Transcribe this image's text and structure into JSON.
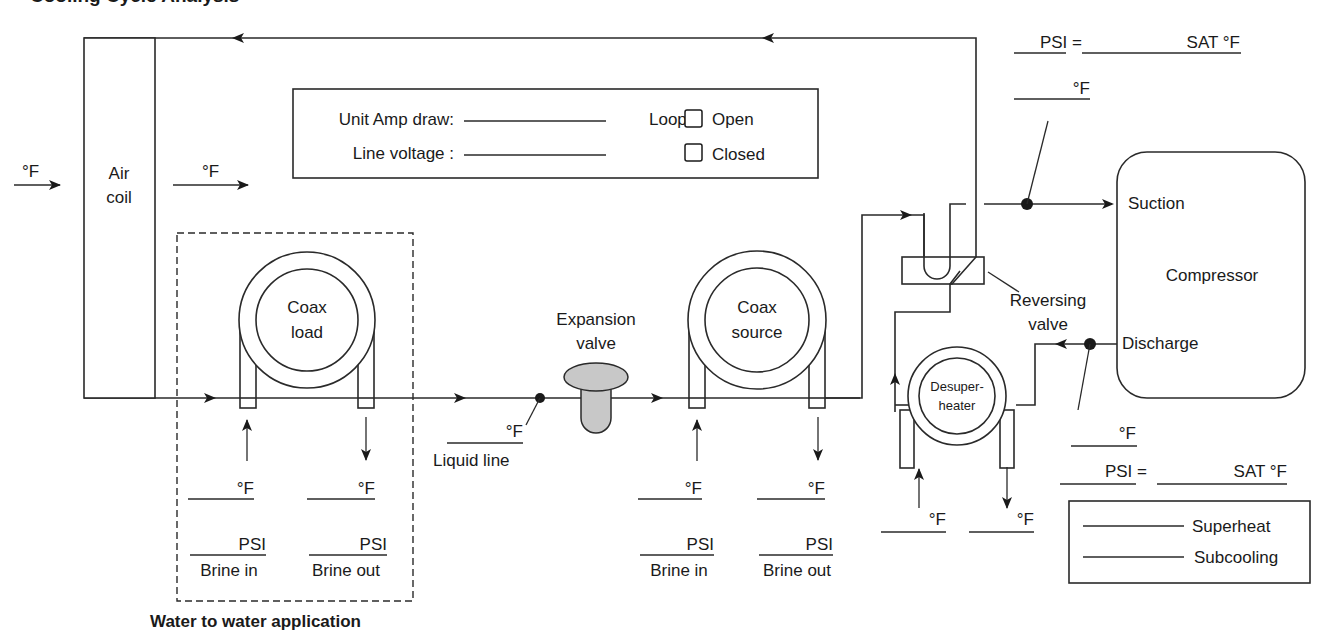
{
  "title_partial": "Cooling Cycle Analysis",
  "components": {
    "air_coil": {
      "line1": "Air",
      "line2": "coil"
    },
    "coax_load": {
      "line1": "Coax",
      "line2": "load"
    },
    "coax_source": {
      "line1": "Coax",
      "line2": "source"
    },
    "expansion_valve": {
      "line1": "Expansion",
      "line2": "valve"
    },
    "desuperheater": {
      "line1": "Desuper-",
      "line2": "heater"
    },
    "reversing_valve": {
      "line1": "Reversing",
      "line2": "valve"
    },
    "compressor": {
      "label": "Compressor",
      "suction": "Suction",
      "discharge": "Discharge"
    }
  },
  "info_box": {
    "amp_label": "Unit Amp draw:",
    "voltage_label": "Line voltage :",
    "loop_label": "Loop:",
    "loop_options": [
      {
        "label": "Open",
        "checked": false
      },
      {
        "label": "Closed",
        "checked": false
      }
    ]
  },
  "measurements": {
    "air_in_temp": "°F",
    "air_out_temp": "°F",
    "liquid_line_temp": "°F",
    "liquid_line_label": "Liquid line",
    "suction_psi": "PSI =",
    "suction_sat": "SAT °F",
    "suction_temp": "°F",
    "discharge_temp": "°F",
    "discharge_psi": "PSI =",
    "discharge_sat": "SAT °F",
    "load": {
      "in_temp": "°F",
      "out_temp": "°F",
      "in_psi": "PSI",
      "out_psi": "PSI",
      "in_label": "Brine in",
      "out_label": "Brine out"
    },
    "source": {
      "in_temp": "°F",
      "out_temp": "°F",
      "in_psi": "PSI",
      "out_psi": "PSI",
      "in_label": "Brine in",
      "out_label": "Brine out"
    },
    "desuperheater": {
      "in_temp": "°F",
      "out_temp": "°F"
    }
  },
  "results_box": {
    "superheat": "Superheat",
    "subcooling": "Subcooling"
  },
  "water_to_water_label": "Water to water application",
  "colors": {
    "line": "#2a2a2a",
    "valve_fill": "#c8c8c8",
    "background": "#ffffff"
  }
}
